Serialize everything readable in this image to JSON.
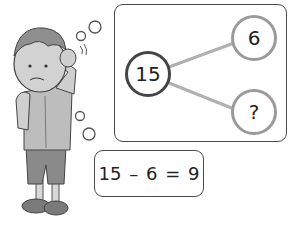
{
  "figure": {
    "number_bond": {
      "whole": "15",
      "part_known": "6",
      "part_unknown": "?"
    },
    "equation": "15 – 6 = 9",
    "illustration": "confused-boy-thinking"
  },
  "colors": {
    "whole_circle": "#454545",
    "part_circles": "#9a9a9a",
    "connector_lines": "#b0b0b0",
    "box_border": "#4a4a4a"
  }
}
